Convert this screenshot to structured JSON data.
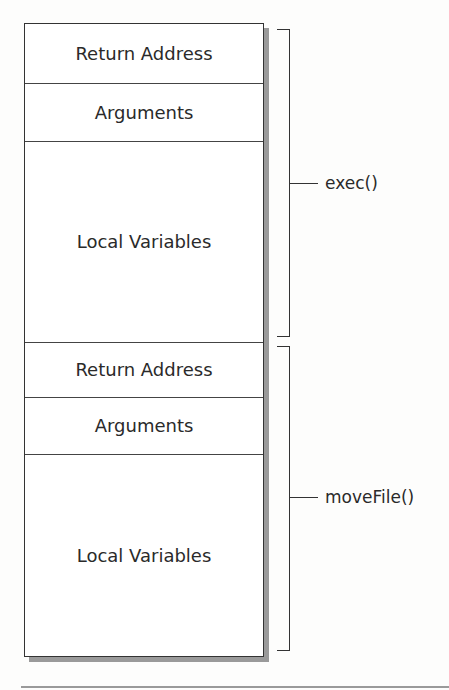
{
  "diagram": {
    "frames": [
      {
        "function_label": "exec()",
        "sections": [
          {
            "label": "Return Address"
          },
          {
            "label": "Arguments"
          },
          {
            "label": "Local Variables"
          }
        ]
      },
      {
        "function_label": "moveFile()",
        "sections": [
          {
            "label": "Return Address"
          },
          {
            "label": "Arguments"
          },
          {
            "label": "Local Variables"
          }
        ]
      }
    ]
  }
}
